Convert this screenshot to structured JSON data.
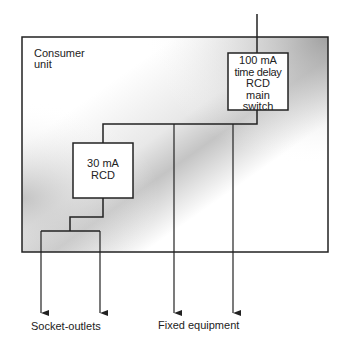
{
  "diagram": {
    "container": {
      "label_line1": "Consumer",
      "label_line2": "unit"
    },
    "main_switch": {
      "lines": [
        "100 mA",
        "time delay",
        "RCD",
        "main",
        "switch"
      ]
    },
    "sub_rcd": {
      "lines": [
        "30 mA",
        "RCD"
      ]
    },
    "outputs": {
      "socket_outlets": "Socket-outlets",
      "fixed_equipment": "Fixed equipment"
    },
    "colors": {
      "line": "#222222",
      "gradient_light": "#ffffff",
      "gradient_dark": "#9a9a9a",
      "box_fill": "#ffffff"
    }
  }
}
